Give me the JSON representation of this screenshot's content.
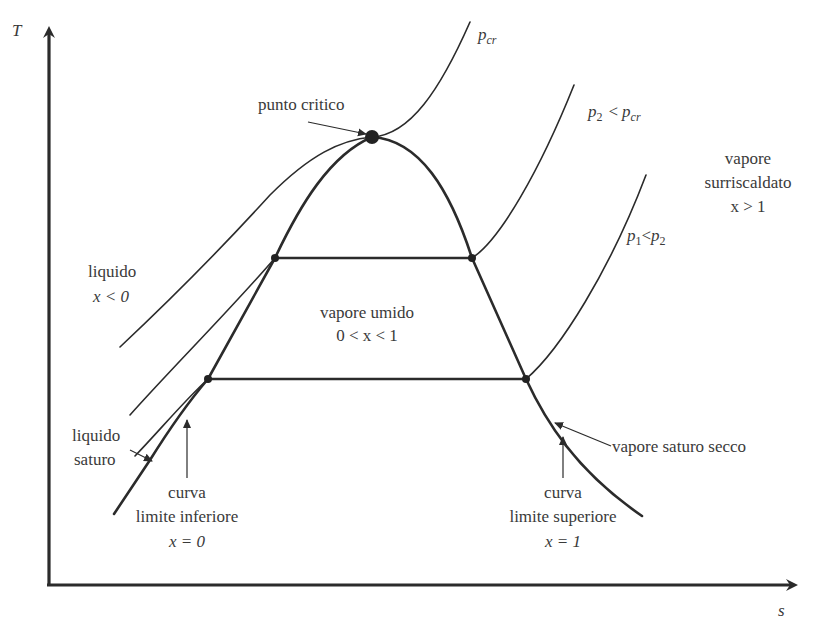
{
  "diagram": {
    "axes": {
      "y_label": "T",
      "x_label": "s"
    },
    "isobars": {
      "pcr": {
        "symbol": "p",
        "subscript": "cr"
      },
      "p2": {
        "symbol": "p",
        "subscript": "2",
        "relation": "<",
        "rhs_symbol": "p",
        "rhs_subscript": "cr"
      },
      "p1": {
        "symbol": "p",
        "subscript": "1",
        "relation": "<",
        "rhs_symbol": "p",
        "rhs_subscript": "2"
      }
    },
    "regions": {
      "liquid": {
        "line1": "liquido",
        "line2": "x < 0"
      },
      "wet_vapor": {
        "line1": "vapore umido",
        "line2": "0 < x < 1"
      },
      "superheated": {
        "line1": "vapore",
        "line2": "surriscaldato",
        "line3": "x > 1"
      }
    },
    "annotations": {
      "critical_point": "punto critico",
      "saturated_liquid": {
        "line1": "liquido",
        "line2": "saturo"
      },
      "dry_saturated_vapor": "vapore saturo secco",
      "lower_limit_curve": {
        "line1": "curva",
        "line2": "limite  inferiore",
        "line3": "x = 0"
      },
      "upper_limit_curve": {
        "line1": "curva",
        "line2": "limite  superiore",
        "line3": "x = 1"
      }
    },
    "colors": {
      "line": "#2b2b2b",
      "text": "#3a3a3a",
      "background": "#ffffff"
    }
  }
}
